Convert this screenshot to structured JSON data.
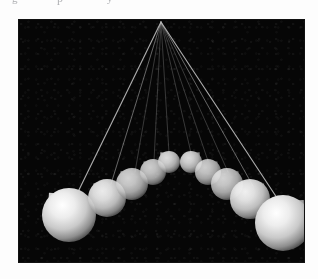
{
  "page": {
    "background_color": "#fdfdfd",
    "width": 318,
    "height": 279,
    "scan_remnants": {
      "glyph_1": "g",
      "glyph_2": "p",
      "glyph_3": "y"
    }
  },
  "figure": {
    "title": "",
    "panel": {
      "x": 19,
      "y": 20,
      "width": 285,
      "height": 242,
      "background_color": "#060606",
      "border_color": "#111111"
    },
    "pivot": {
      "x": 142,
      "y": 2
    },
    "sphere_color": "#e8e8e8",
    "sphere_shadow_color": "#6a6a6a",
    "string_color": "#b9b9b9",
    "spheres": [
      {
        "id": "left-5",
        "cx": 50,
        "cy": 195,
        "r": 27,
        "tail_angle": -42,
        "tail_len": 30,
        "brightness": 1.0
      },
      {
        "id": "left-4",
        "cx": 88,
        "cy": 178,
        "r": 19,
        "tail_angle": -42,
        "tail_len": 20,
        "brightness": 0.92
      },
      {
        "id": "left-3",
        "cx": 113,
        "cy": 164,
        "r": 16,
        "tail_angle": -42,
        "tail_len": 17,
        "brightness": 0.82
      },
      {
        "id": "left-2",
        "cx": 134,
        "cy": 152,
        "r": 13,
        "tail_angle": -42,
        "tail_len": 14,
        "brightness": 0.8
      },
      {
        "id": "left-1",
        "cx": 150,
        "cy": 142,
        "r": 11,
        "tail_angle": -42,
        "tail_len": 13,
        "brightness": 0.86
      },
      {
        "id": "right-1",
        "cx": 172,
        "cy": 142,
        "r": 11,
        "tail_angle": 42,
        "tail_len": 13,
        "brightness": 0.86
      },
      {
        "id": "right-2",
        "cx": 189,
        "cy": 152,
        "r": 13,
        "tail_angle": 42,
        "tail_len": 14,
        "brightness": 0.8
      },
      {
        "id": "right-3",
        "cx": 208,
        "cy": 164,
        "r": 16,
        "tail_angle": 42,
        "tail_len": 17,
        "brightness": 0.82
      },
      {
        "id": "right-4",
        "cx": 231,
        "cy": 179,
        "r": 20,
        "tail_angle": 42,
        "tail_len": 21,
        "brightness": 0.94
      },
      {
        "id": "right-5",
        "cx": 264,
        "cy": 203,
        "r": 28,
        "tail_angle": 42,
        "tail_len": 31,
        "brightness": 1.0
      }
    ],
    "strings": [
      {
        "id": "string-left-5",
        "x1": 142,
        "y1": 2,
        "x2": 56,
        "y2": 178
      },
      {
        "id": "string-left-4",
        "x1": 142,
        "y1": 2,
        "x2": 92,
        "y2": 164
      },
      {
        "id": "string-left-3",
        "x1": 142,
        "y1": 2,
        "x2": 116,
        "y2": 152
      },
      {
        "id": "string-left-2",
        "x1": 142,
        "y1": 2,
        "x2": 135,
        "y2": 141
      },
      {
        "id": "string-left-1",
        "x1": 142,
        "y1": 2,
        "x2": 150,
        "y2": 133
      },
      {
        "id": "string-right-1",
        "x1": 142,
        "y1": 2,
        "x2": 172,
        "y2": 133
      },
      {
        "id": "string-right-2",
        "x1": 142,
        "y1": 2,
        "x2": 189,
        "y2": 141
      },
      {
        "id": "string-right-3",
        "x1": 142,
        "y1": 2,
        "x2": 209,
        "y2": 152
      },
      {
        "id": "string-right-4",
        "x1": 142,
        "y1": 2,
        "x2": 234,
        "y2": 166
      },
      {
        "id": "string-right-5",
        "x1": 142,
        "y1": 2,
        "x2": 262,
        "y2": 184
      }
    ]
  }
}
